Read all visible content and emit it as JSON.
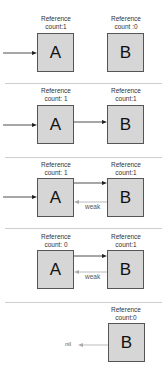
{
  "panels": [
    {
      "a": {
        "label_line1": "Reference",
        "label_line2": "count:1",
        "name": "A"
      },
      "b": {
        "label_line1": "Reference",
        "label_line2": "count :0",
        "name": "B"
      }
    },
    {
      "a": {
        "label_line1": "Reference",
        "label_line2": "count: 1",
        "name": "A"
      },
      "b": {
        "label_line1": "Reference",
        "label_line2": "count:1",
        "name": "B"
      }
    },
    {
      "a": {
        "label_line1": "Reference",
        "label_line2": "count: 1",
        "name": "A"
      },
      "b": {
        "label_line1": "Reference",
        "label_line2": "count:1",
        "name": "B"
      },
      "weak_label": "weak"
    },
    {
      "a": {
        "label_line1": "Reference",
        "label_line2": "count: 0",
        "name": "A"
      },
      "b": {
        "label_line1": "Reference",
        "label_line2": "count:1",
        "name": "B"
      },
      "weak_label": "weak"
    },
    {
      "b": {
        "label_line1": "Reference",
        "label_line2": "count:0",
        "name": "B"
      },
      "nil_label": "nil"
    }
  ],
  "colors": {
    "box_fill": "#d6d6d6",
    "box_border": "#555555",
    "strong_arrow": "#222222",
    "weak_arrow": "#aaaaaa",
    "divider": "#cfcfcf"
  }
}
